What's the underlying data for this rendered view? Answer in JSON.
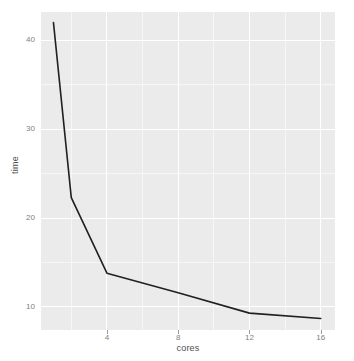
{
  "chart_data": {
    "type": "line",
    "title": "",
    "subtitle": "",
    "xlabel": "cores",
    "ylabel": "time",
    "x": [
      1,
      2,
      4,
      8,
      12,
      16
    ],
    "values": [
      42.0,
      22.3,
      13.8,
      11.6,
      9.3,
      8.7
    ],
    "series": [
      {
        "name": "time",
        "values": [
          42.0,
          22.3,
          13.8,
          11.6,
          9.3,
          8.7
        ]
      }
    ],
    "xlim": [
      0.3,
      16.8
    ],
    "ylim": [
      7.4,
      43.2
    ],
    "xticks": [
      4,
      8,
      12,
      16
    ],
    "xtick_labels": [
      "4",
      "8",
      "12",
      "16"
    ],
    "x_minor_ticks": [
      2,
      6,
      10,
      14
    ],
    "yticks": [
      10,
      20,
      30,
      40
    ],
    "ytick_labels": [
      "10",
      "20",
      "30",
      "40"
    ],
    "y_minor_ticks": [
      15,
      25,
      35
    ],
    "grid": true,
    "legend": false,
    "legend_position": "none",
    "panel_background": "#ebebeb",
    "grid_color": "#ffffff",
    "line_color": "#231f20",
    "axis_text_color": "#808080",
    "axis_title_color": "#4d4d4d",
    "plot_background": "#ffffff"
  }
}
